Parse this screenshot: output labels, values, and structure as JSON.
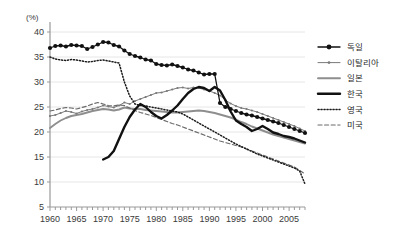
{
  "chart_data": {
    "type": "line",
    "title": "",
    "subtitle": "",
    "xlabel": "",
    "ylabel": "(%)",
    "unit_label": "(%)",
    "xlim": [
      1960,
      2008
    ],
    "ylim": [
      5,
      40
    ],
    "ytick_step": 5,
    "yticks": [
      "40",
      "35",
      "30",
      "25",
      "20",
      "15",
      "10",
      "5"
    ],
    "ytick_values": [
      40,
      35,
      30,
      25,
      20,
      15,
      10,
      5
    ],
    "xticks": [
      "1960",
      "1965",
      "1970",
      "1975",
      "1980",
      "1985",
      "1990",
      "1995",
      "2000",
      "2005"
    ],
    "xtick_values": [
      1960,
      1965,
      1970,
      1975,
      1980,
      1985,
      1990,
      1995,
      2000,
      2005
    ],
    "minor_xtick_interval": 1,
    "grid": "horizontal",
    "legend_position": "right",
    "series": [
      {
        "name": "독일",
        "style": "line-marker-circle",
        "color": "#111111",
        "x": [
          1960,
          1961,
          1962,
          1963,
          1964,
          1965,
          1966,
          1967,
          1968,
          1969,
          1970,
          1971,
          1972,
          1973,
          1974,
          1975,
          1976,
          1977,
          1978,
          1979,
          1980,
          1981,
          1982,
          1983,
          1984,
          1985,
          1986,
          1987,
          1988,
          1989,
          1990,
          1991,
          1992,
          1993,
          1994,
          1995,
          1996,
          1997,
          1998,
          1999,
          2000,
          2001,
          2002,
          2003,
          2004,
          2005,
          2006,
          2007,
          2008
        ],
        "values": [
          36.8,
          37.2,
          37.3,
          37.1,
          37.4,
          37.3,
          37.2,
          36.6,
          37.0,
          37.5,
          38.0,
          37.9,
          37.4,
          37.1,
          36.3,
          35.6,
          35.2,
          34.9,
          34.5,
          34.3,
          33.6,
          33.4,
          33.3,
          33.5,
          33.2,
          32.9,
          32.5,
          32.3,
          31.9,
          31.5,
          31.6,
          31.6,
          25.8,
          25.0,
          24.6,
          24.2,
          23.8,
          23.5,
          23.3,
          23.0,
          22.7,
          22.4,
          22.1,
          21.8,
          21.4,
          21.0,
          20.6,
          20.2,
          19.8
        ]
      },
      {
        "name": "이탈리아",
        "style": "line-marker-dot",
        "color": "#7a7a7a",
        "x": [
          1960,
          1961,
          1962,
          1963,
          1964,
          1965,
          1966,
          1967,
          1968,
          1969,
          1970,
          1971,
          1972,
          1973,
          1974,
          1975,
          1976,
          1977,
          1978,
          1979,
          1980,
          1981,
          1982,
          1983,
          1984,
          1985,
          1986,
          1987,
          1988,
          1989,
          1990,
          1991,
          1992,
          1993,
          1994,
          1995,
          1996,
          1997,
          1998,
          1999,
          2000,
          2001,
          2002,
          2003,
          2004,
          2005,
          2006,
          2007,
          2008
        ],
        "values": [
          23.2,
          23.4,
          23.8,
          24.2,
          24.0,
          23.7,
          24.1,
          24.4,
          24.6,
          24.9,
          25.3,
          25.1,
          24.9,
          25.3,
          25.9,
          25.6,
          26.2,
          26.6,
          27.0,
          27.4,
          27.8,
          27.9,
          28.2,
          28.5,
          28.8,
          28.9,
          28.7,
          28.9,
          28.8,
          28.5,
          28.2,
          27.8,
          27.3,
          26.4,
          25.7,
          25.2,
          24.8,
          24.6,
          24.3,
          24.0,
          23.6,
          23.2,
          22.8,
          22.4,
          22.0,
          21.6,
          21.2,
          20.7,
          20.2
        ]
      },
      {
        "name": "일본",
        "style": "line-plain",
        "color": "#8e8e8e",
        "x": [
          1960,
          1961,
          1962,
          1963,
          1964,
          1965,
          1966,
          1967,
          1968,
          1969,
          1970,
          1971,
          1972,
          1973,
          1974,
          1975,
          1976,
          1977,
          1978,
          1979,
          1980,
          1981,
          1982,
          1983,
          1984,
          1985,
          1986,
          1987,
          1988,
          1989,
          1990,
          1991,
          1992,
          1993,
          1994,
          1995,
          1996,
          1997,
          1998,
          1999,
          2000,
          2001,
          2002,
          2003,
          2004,
          2005,
          2006,
          2007,
          2008
        ],
        "values": [
          20.8,
          21.6,
          22.3,
          22.8,
          23.2,
          23.4,
          23.6,
          23.9,
          24.2,
          24.4,
          24.6,
          24.5,
          24.3,
          24.5,
          24.9,
          24.7,
          24.6,
          24.6,
          24.4,
          24.3,
          24.2,
          24.1,
          24.0,
          23.9,
          23.9,
          24.0,
          24.1,
          24.2,
          24.3,
          24.2,
          24.0,
          23.8,
          23.5,
          23.2,
          22.9,
          22.5,
          22.0,
          21.6,
          21.1,
          20.7,
          20.3,
          19.9,
          19.5,
          19.2,
          18.9,
          18.6,
          18.3,
          18.0,
          17.7
        ]
      },
      {
        "name": "한국",
        "style": "line-thick",
        "color": "#111111",
        "x": [
          1970,
          1971,
          1972,
          1973,
          1974,
          1975,
          1976,
          1977,
          1978,
          1979,
          1980,
          1981,
          1982,
          1983,
          1984,
          1985,
          1986,
          1987,
          1988,
          1989,
          1990,
          1991,
          1992,
          1993,
          1994,
          1995,
          1996,
          1997,
          1998,
          1999,
          2000,
          2001,
          2002,
          2003,
          2004,
          2005,
          2006,
          2007,
          2008
        ],
        "values": [
          14.5,
          15.0,
          16.2,
          18.6,
          21.0,
          23.0,
          24.5,
          25.6,
          25.0,
          24.0,
          23.2,
          22.7,
          23.4,
          24.3,
          25.3,
          26.6,
          27.8,
          28.6,
          29.0,
          28.8,
          28.2,
          29.0,
          28.3,
          26.4,
          24.1,
          22.3,
          21.6,
          21.0,
          20.2,
          20.6,
          21.2,
          20.6,
          19.9,
          19.6,
          19.2,
          19.0,
          18.7,
          18.3,
          17.9
        ]
      },
      {
        "name": "영국",
        "style": "line-dotted",
        "color": "#1a1a1a",
        "x": [
          1960,
          1961,
          1962,
          1963,
          1964,
          1965,
          1966,
          1967,
          1968,
          1969,
          1970,
          1971,
          1972,
          1973,
          1974,
          1975,
          1976,
          1977,
          1978,
          1979,
          1980,
          1981,
          1982,
          1983,
          1984,
          1985,
          1986,
          1987,
          1988,
          1989,
          1990,
          1991,
          1992,
          1993,
          1994,
          1995,
          1996,
          1997,
          1998,
          1999,
          2000,
          2001,
          2002,
          2003,
          2004,
          2005,
          2006,
          2007,
          2008
        ],
        "values": [
          35.0,
          34.6,
          34.4,
          34.3,
          34.5,
          34.4,
          34.2,
          34.0,
          34.1,
          34.3,
          34.4,
          34.2,
          34.0,
          33.8,
          30.0,
          27.2,
          25.6,
          25.3,
          25.2,
          25.0,
          24.8,
          24.6,
          24.4,
          24.2,
          24.0,
          23.6,
          23.0,
          22.4,
          21.8,
          21.2,
          20.6,
          20.0,
          19.4,
          18.8,
          18.2,
          17.6,
          17.1,
          16.6,
          16.1,
          15.6,
          15.2,
          14.8,
          14.4,
          14.0,
          13.6,
          13.2,
          12.8,
          12.2,
          9.6
        ]
      },
      {
        "name": "미국",
        "style": "line-dashed",
        "color": "#6a6a6a",
        "x": [
          1960,
          1961,
          1962,
          1963,
          1964,
          1965,
          1966,
          1967,
          1968,
          1969,
          1970,
          1971,
          1972,
          1973,
          1974,
          1975,
          1976,
          1977,
          1978,
          1979,
          1980,
          1981,
          1982,
          1983,
          1984,
          1985,
          1986,
          1987,
          1988,
          1989,
          1990,
          1991,
          1992,
          1993,
          1994,
          1995,
          1996,
          1997,
          1998,
          1999,
          2000,
          2001,
          2002,
          2003,
          2004,
          2005,
          2006,
          2007,
          2008
        ],
        "values": [
          24.2,
          24.4,
          24.7,
          24.9,
          24.8,
          24.6,
          24.9,
          25.2,
          25.6,
          25.9,
          25.6,
          25.3,
          25.2,
          25.4,
          25.3,
          24.8,
          24.3,
          23.9,
          23.6,
          23.3,
          22.9,
          22.5,
          22.1,
          21.7,
          21.4,
          21.0,
          20.6,
          20.2,
          19.8,
          19.4,
          19.0,
          18.6,
          18.2,
          17.9,
          17.6,
          17.3,
          17.0,
          16.6,
          16.2,
          15.8,
          15.4,
          15.0,
          14.6,
          14.2,
          13.8,
          13.4,
          13.0,
          12.3,
          11.6
        ]
      }
    ]
  },
  "legend": {
    "items": [
      {
        "label": "독일",
        "style": "line-marker-circle"
      },
      {
        "label": "이탈리아",
        "style": "line-marker-dot"
      },
      {
        "label": "일본",
        "style": "line-plain"
      },
      {
        "label": "한국",
        "style": "line-thick"
      },
      {
        "label": "영국",
        "style": "line-dotted"
      },
      {
        "label": "미국",
        "style": "line-dashed"
      }
    ]
  },
  "colors": {
    "background": "#ffffff",
    "axis": "#999999",
    "grid": "#e6e6e6",
    "text": "#3a3a3a",
    "dark_series": "#111111",
    "gray_series": "#8e8e8e"
  }
}
